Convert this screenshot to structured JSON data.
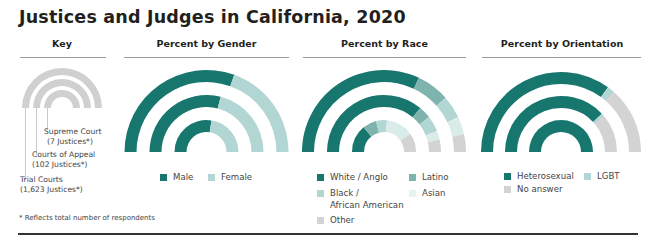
{
  "title": "Justices and Judges in California, 2020",
  "headers": {
    "key": "Key",
    "gender": "Percent by Gender",
    "race": "Percent by Race",
    "orientation": "Percent by Orientation"
  },
  "key": {
    "supreme_line1": "Supreme Court",
    "supreme_line2": "(7 Justices*)",
    "appeal_line1": "Courts of Appeal",
    "appeal_line2": "(102 Justices*)",
    "trial_line1": "Trial Courts",
    "trial_line2": "(1,623 Justices*)"
  },
  "legend": {
    "gender": [
      "Male",
      "Female"
    ],
    "race": [
      "White / Anglo",
      "Latino",
      "Black /",
      "African American",
      "Asian",
      "Other"
    ],
    "orientation": [
      "Heterosexual",
      "LGBT",
      "No answer"
    ]
  },
  "note": "* Reflects total number of respondents",
  "colors": {
    "teal": "#17776f",
    "teal_mid": "#7fb3ae",
    "teal_light": "#b2d6d3",
    "teal_pale": "#daecea",
    "gray": "#d3d3d3",
    "key_gray": "#d0d0d0"
  },
  "chart_data": [
    {
      "type": "donut-semicircle",
      "title": "Percent by Gender",
      "rings": [
        "Trial Courts (outer)",
        "Courts of Appeal (middle)",
        "Supreme Court (inner)"
      ],
      "series": [
        {
          "name": "Male",
          "values": [
            61,
            58,
            55
          ]
        },
        {
          "name": "Female",
          "values": [
            39,
            42,
            45
          ]
        }
      ]
    },
    {
      "type": "donut-semicircle",
      "title": "Percent by Race",
      "rings": [
        "Trial Courts (outer)",
        "Courts of Appeal (middle)",
        "Supreme Court (inner)"
      ],
      "series": [
        {
          "name": "White / Anglo",
          "values": [
            64,
            72,
            28
          ]
        },
        {
          "name": "Latino",
          "values": [
            13,
            7,
            14
          ]
        },
        {
          "name": "Black / African American",
          "values": [
            9,
            9,
            11
          ]
        },
        {
          "name": "Asian",
          "values": [
            7,
            5,
            28
          ]
        },
        {
          "name": "Other",
          "values": [
            7,
            7,
            19
          ]
        }
      ]
    },
    {
      "type": "donut-semicircle",
      "title": "Percent by Orientation",
      "rings": [
        "Trial Courts (outer)",
        "Courts of Appeal (middle)",
        "Supreme Court (inner)"
      ],
      "series": [
        {
          "name": "Heterosexual",
          "values": [
            70,
            76,
            100
          ]
        },
        {
          "name": "LGBT",
          "values": [
            3,
            2,
            0
          ]
        },
        {
          "name": "No answer",
          "values": [
            27,
            22,
            0
          ]
        }
      ]
    }
  ]
}
